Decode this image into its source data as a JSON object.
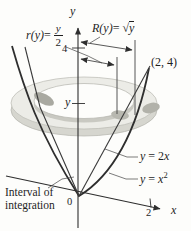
{
  "figure": {
    "background": "#fdfdfb",
    "ink": "#2e2e2e",
    "ring": {
      "top_fill": "#ececе7",
      "side_fill": "#d6d6cf",
      "hole_fill": "#fdfdfb",
      "edge": "#b3b3ac",
      "patch_fill": "#a9a9a1"
    },
    "labels": {
      "y_axis": "y",
      "x_axis": "x",
      "origin": "0",
      "y_tick_4": "4",
      "x_tick_2": "2",
      "slice_height": "y",
      "point_2_4": "(2, 4)",
      "interval_line1": "Interval of",
      "interval_line2": "integration",
      "inner_radius": {
        "fn": "r(y)",
        "eq": " = ",
        "num": "y",
        "den": "2"
      },
      "outer_radius": {
        "fn": "R(y)",
        "eq": " = ",
        "radical": "√",
        "radicand": "y"
      },
      "line_eq": {
        "lhs": "y",
        "eq": " = ",
        "rhs_coef": "2",
        "rhs_var": "x"
      },
      "parabola_eq": {
        "lhs": "y",
        "eq": " = ",
        "rhs_var": "x",
        "rhs_exp": "2"
      }
    }
  }
}
